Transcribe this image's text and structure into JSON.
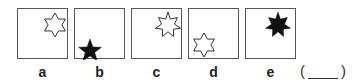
{
  "figures": [
    {
      "label": "a",
      "left": 17,
      "shape": "6-point-star",
      "fill": "outline",
      "position": "top-right"
    },
    {
      "label": "b",
      "left": 74,
      "shape": "5-point-star",
      "fill": "filled",
      "position": "bottom-left"
    },
    {
      "label": "c",
      "left": 131,
      "shape": "7-point-star",
      "fill": "outline",
      "position": "top-right"
    },
    {
      "label": "d",
      "left": 188,
      "shape": "6-point-star",
      "fill": "outline",
      "position": "bottom-left"
    },
    {
      "label": "e",
      "left": 245,
      "shape": "7-point-star",
      "fill": "filled",
      "position": "top-right"
    }
  ],
  "answer": {
    "open": "(",
    "close": ")"
  },
  "colors": {
    "stroke": "#333333",
    "fill": "#111111",
    "border": "#555555"
  }
}
